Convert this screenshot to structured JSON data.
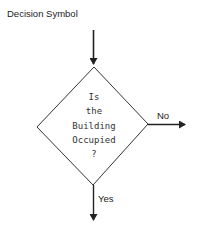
{
  "title": "Decision Symbol",
  "decision": {
    "lines": [
      "Is",
      "the",
      "Building",
      "Occupied",
      "?"
    ]
  },
  "branches": {
    "right_label": "No",
    "down_label": "Yes"
  },
  "colors": {
    "stroke": "#222222",
    "background": "#ffffff"
  }
}
